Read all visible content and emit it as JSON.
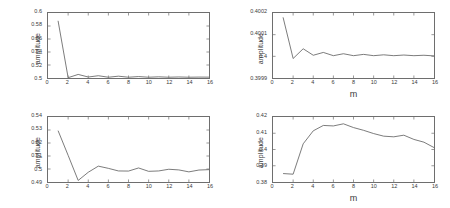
{
  "figure": {
    "background": "#ffffff",
    "line_color": "#5a5a5a",
    "axis_color": "#6e6e6e",
    "text_color": "#3a3a3a"
  },
  "chart_data": [
    {
      "id": "top-left",
      "type": "line",
      "title": "",
      "xlabel": "",
      "ylabel": "amplitude",
      "xlim": [
        0,
        16
      ],
      "ylim": [
        0.5,
        0.6
      ],
      "grid": false,
      "legend": "none",
      "xticks": [
        0,
        2,
        4,
        6,
        8,
        10,
        12,
        14,
        16
      ],
      "xticklabels": [
        "0",
        "2",
        "4",
        "6",
        "8",
        "10",
        "12",
        "14",
        "16"
      ],
      "yticks": [
        0.5,
        0.52,
        0.54,
        0.56,
        0.58,
        0.6
      ],
      "yticklabels": [
        "0.5",
        "0.52",
        "0.54",
        "0.56",
        "0.58",
        "0.6"
      ],
      "x": [
        1,
        2,
        3,
        4,
        5,
        6,
        7,
        8,
        9,
        10,
        11,
        12,
        13,
        14,
        15,
        16
      ],
      "values": [
        0.588,
        0.5005,
        0.5055,
        0.5015,
        0.5035,
        0.5012,
        0.5028,
        0.5012,
        0.5022,
        0.5012,
        0.5018,
        0.5012,
        0.5016,
        0.5012,
        0.5014,
        0.5013
      ]
    },
    {
      "id": "top-right",
      "type": "line",
      "title": "",
      "xlabel": "m",
      "ylabel": "amplitude",
      "xlim": [
        0,
        16
      ],
      "ylim": [
        0.3999,
        0.4002
      ],
      "grid": false,
      "legend": "none",
      "xticks": [
        0,
        2,
        4,
        6,
        8,
        10,
        12,
        14,
        16
      ],
      "xticklabels": [
        "0",
        "2",
        "4",
        "6",
        "8",
        "10",
        "12",
        "14",
        "16"
      ],
      "yticks": [
        0.3999,
        0.4,
        0.4001,
        0.4002
      ],
      "yticklabels": [
        "0.3999",
        "0.4",
        "0.4001",
        "0.4002"
      ],
      "x": [
        1,
        2,
        3,
        4,
        5,
        6,
        7,
        8,
        9,
        10,
        11,
        12,
        13,
        14,
        15,
        16
      ],
      "values": [
        0.40018,
        0.39999,
        0.400035,
        0.400005,
        0.400018,
        0.400003,
        0.400012,
        0.400003,
        0.400009,
        0.400003,
        0.400007,
        0.400003,
        0.400006,
        0.400003,
        0.400005,
        0.400002
      ]
    },
    {
      "id": "bottom-left",
      "type": "line",
      "title": "",
      "xlabel": "",
      "ylabel": "amplitude",
      "xlim": [
        0,
        16
      ],
      "ylim": [
        0.49,
        0.54
      ],
      "grid": false,
      "legend": "none",
      "xticks": [
        0,
        2,
        4,
        6,
        8,
        10,
        12,
        14,
        16
      ],
      "xticklabels": [
        "0",
        "2",
        "4",
        "6",
        "8",
        "10",
        "12",
        "14",
        "16"
      ],
      "yticks": [
        0.49,
        0.5,
        0.51,
        0.52,
        0.53,
        0.54
      ],
      "yticklabels": [
        "0.49",
        "0.5",
        "0.51",
        "0.52",
        "0.53",
        "0.54"
      ],
      "x": [
        1,
        2,
        3,
        4,
        5,
        6,
        7,
        8,
        9,
        10,
        11,
        12,
        13,
        14,
        15,
        16
      ],
      "values": [
        0.5295,
        0.5105,
        0.4912,
        0.4975,
        0.5022,
        0.5005,
        0.4985,
        0.4984,
        0.5008,
        0.4982,
        0.4985,
        0.4998,
        0.4993,
        0.4978,
        0.4992,
        0.4995
      ]
    },
    {
      "id": "bottom-right",
      "type": "line",
      "title": "",
      "xlabel": "m",
      "ylabel": "amplitude",
      "xlim": [
        0,
        16
      ],
      "ylim": [
        0.38,
        0.42
      ],
      "grid": false,
      "legend": "none",
      "xticks": [
        0,
        2,
        4,
        6,
        8,
        10,
        12,
        14,
        16
      ],
      "xticklabels": [
        "0",
        "2",
        "4",
        "6",
        "8",
        "10",
        "12",
        "14",
        "16"
      ],
      "yticks": [
        0.38,
        0.39,
        0.4,
        0.41,
        0.42
      ],
      "yticklabels": [
        "0.38",
        "0.39",
        "0.4",
        "0.41",
        "0.42"
      ],
      "x": [
        1,
        2,
        3,
        4,
        5,
        6,
        7,
        8,
        9,
        10,
        11,
        12,
        13,
        14,
        15,
        16
      ],
      "values": [
        0.3852,
        0.3848,
        0.4035,
        0.4115,
        0.4148,
        0.4145,
        0.4158,
        0.4135,
        0.4118,
        0.4098,
        0.4082,
        0.4078,
        0.4088,
        0.4062,
        0.4045,
        0.4012
      ]
    }
  ]
}
